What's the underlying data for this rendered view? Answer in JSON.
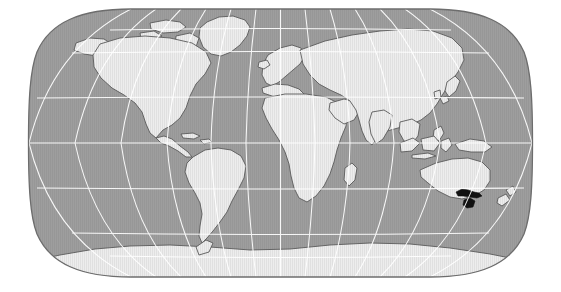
{
  "figure": {
    "kind": "world-locator-map",
    "title": "",
    "caption": "",
    "projection": "Eckert / Robinson pseudocylindrical equal-area world projection",
    "width": 561,
    "height": 292
  },
  "colors": {
    "background": "#ffffff",
    "ocean": "#9b9b9b",
    "land": "#e9e9e9",
    "land_outline": "#5a5a5a",
    "graticule": "#ffffff",
    "frame": "#6d6d6d",
    "highlight": "#111111",
    "hatch": "#dcdcdc"
  },
  "graticule": {
    "visible": true,
    "parallel_interval_deg": 30,
    "meridian_interval_deg": 30,
    "parallels_deg": [
      75,
      60,
      30,
      0,
      -30,
      -60,
      -75
    ],
    "meridians_deg": [
      -180,
      -150,
      -120,
      -90,
      -60,
      -30,
      0,
      30,
      60,
      90,
      120,
      150,
      180
    ],
    "equator_deg": 0,
    "central_meridian_deg": 0,
    "line_color": "#ffffff",
    "line_width_px": 1
  },
  "extent": {
    "left_px": 29,
    "right_px": 532,
    "top_px": 9,
    "bottom_px": 277,
    "lon_range_deg": [
      -180,
      180
    ],
    "lat_range_deg": [
      -90,
      90
    ]
  },
  "highlight_region": {
    "name": "Victoria and Tasmania, Australia",
    "short_label": "Victoria / Tasmania",
    "color": "#111111",
    "continent": "Australia",
    "approx_center_lon_deg": 145.5,
    "approx_center_lat_deg": -39.0,
    "pixel_center": {
      "x": 471,
      "y": 198
    }
  },
  "landmasses": [
    {
      "name": "North America",
      "fill": "land"
    },
    {
      "name": "Greenland",
      "fill": "land"
    },
    {
      "name": "South America",
      "fill": "land"
    },
    {
      "name": "Europe",
      "fill": "land"
    },
    {
      "name": "Africa",
      "fill": "land"
    },
    {
      "name": "Asia",
      "fill": "land"
    },
    {
      "name": "Australia",
      "fill": "land"
    },
    {
      "name": "New Zealand",
      "fill": "land"
    },
    {
      "name": "Indonesia and Maritime Southeast Asia",
      "fill": "land"
    },
    {
      "name": "Japan",
      "fill": "land"
    },
    {
      "name": "Madagascar",
      "fill": "land"
    },
    {
      "name": "Antarctica",
      "fill": "land"
    },
    {
      "name": "Victoria and Tasmania",
      "fill": "highlight"
    }
  ],
  "legend": {
    "visible": false,
    "items": []
  },
  "labels": {
    "visible": false,
    "items": []
  },
  "scale_bar": {
    "visible": false
  }
}
